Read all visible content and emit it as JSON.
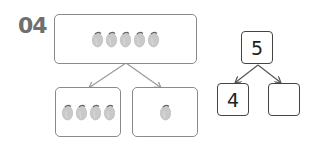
{
  "problem": {
    "number": "04"
  },
  "picture_bond": {
    "whole": {
      "count": 5,
      "item": "lemon-icon"
    },
    "parts": [
      {
        "count": 4,
        "item": "lemon-icon"
      },
      {
        "count": 1,
        "item": "lemon-icon"
      }
    ]
  },
  "number_bond": {
    "whole": "5",
    "parts": [
      "4",
      ""
    ]
  },
  "colors": {
    "box_border": "#8a8a8a",
    "lemon": "#c9c9c9",
    "heading": "#6f6f6f"
  }
}
